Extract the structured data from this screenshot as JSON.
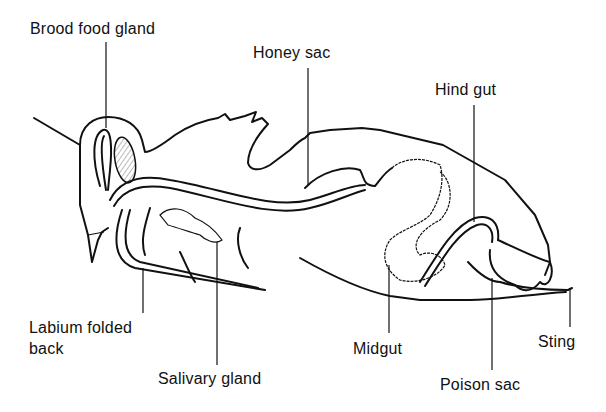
{
  "diagram": {
    "labels": [
      {
        "id": "brood-food-gland",
        "text": "Brood food gland"
      },
      {
        "id": "honey-sac",
        "text": "Honey sac"
      },
      {
        "id": "hind-gut",
        "text": "Hind gut"
      },
      {
        "id": "labium-folded-back",
        "text": "Labium folded back"
      },
      {
        "id": "salivary-gland",
        "text": "Salivary gland"
      },
      {
        "id": "midgut",
        "text": "Midgut"
      },
      {
        "id": "poison-sac",
        "text": "Poison sac"
      },
      {
        "id": "sting",
        "text": "Sting"
      }
    ],
    "label_lines": {
      "labium_line1": "Labium folded",
      "labium_line2": "back"
    }
  }
}
